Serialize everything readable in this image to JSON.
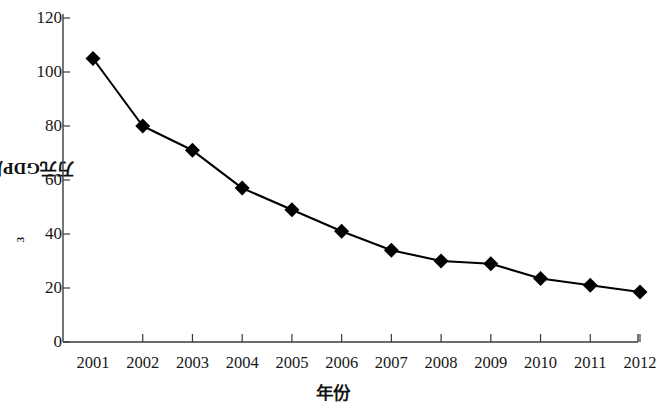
{
  "chart_data": {
    "type": "line",
    "title": "",
    "subtitle": "",
    "xlabel": "年份",
    "ylabel": "万元GDP用水量/米³",
    "ylabel_base": "万元GDP用水量/米",
    "ylabel_sup": "3",
    "categories": [
      "2001",
      "2002",
      "2003",
      "2004",
      "2005",
      "2006",
      "2007",
      "2008",
      "2009",
      "2010",
      "2011",
      "2012"
    ],
    "x": [
      2001,
      2002,
      2003,
      2004,
      2005,
      2006,
      2007,
      2008,
      2009,
      2010,
      2011,
      2012
    ],
    "values": [
      105,
      80,
      71,
      57,
      49,
      41,
      34,
      30,
      29,
      23.5,
      21,
      18.5
    ],
    "series": [
      {
        "name": "万元GDP用水量",
        "values": [
          105,
          80,
          71,
          57,
          49,
          41,
          34,
          30,
          29,
          23.5,
          21,
          18.5
        ]
      }
    ],
    "ylim": [
      0,
      120
    ],
    "yticks": [
      0,
      20,
      40,
      60,
      80,
      100,
      120
    ],
    "yticklabels": [
      "0",
      "20",
      "40",
      "60",
      "80",
      "100",
      "120"
    ],
    "xlim": [
      2000.6,
      2012.4
    ],
    "grid": false,
    "legend": false,
    "legend_position": "none",
    "marker": "diamond",
    "line_color": "#000000",
    "marker_color": "#000000",
    "axis_color": "#3a3a3a",
    "background": "#ffffff"
  }
}
